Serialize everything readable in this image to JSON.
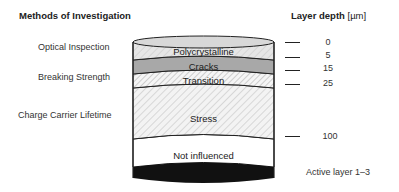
{
  "headers": {
    "methods": "Methods of Investigation",
    "depth_title": "Layer depth",
    "depth_unit": "[µm]"
  },
  "methods": [
    {
      "label": "Optical Inspection"
    },
    {
      "label": "Breaking Strength"
    },
    {
      "label": "Charge Carrier Lifetime"
    }
  ],
  "layers": [
    {
      "label": "Polycrystalline",
      "fill": "#e4e4e4",
      "pattern": "hatch-light"
    },
    {
      "label": "Cracks",
      "fill": "#a9a9a9",
      "pattern": "solid"
    },
    {
      "label": "Transition",
      "fill": "#f2f2f2",
      "pattern": "hatch-dense"
    },
    {
      "label": "Stress",
      "fill": "#f4f4f4",
      "pattern": "hatch-light"
    },
    {
      "label": "Not influenced",
      "fill": "#ffffff",
      "pattern": "none"
    },
    {
      "label": "",
      "fill": "#111111",
      "pattern": "solid"
    }
  ],
  "depth_ticks": [
    {
      "value": "0"
    },
    {
      "value": "5"
    },
    {
      "value": "15"
    },
    {
      "value": "25"
    },
    {
      "value": "100"
    }
  ],
  "footer": {
    "active_layer": "Active layer 1–3"
  }
}
